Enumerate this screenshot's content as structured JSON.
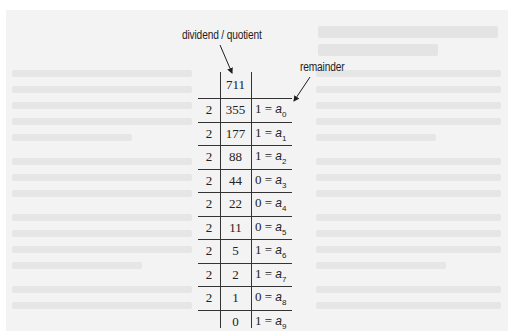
{
  "diagram": {
    "labels": {
      "dividend_quotient": "dividend / quotient",
      "remainder": "remainder"
    },
    "divisor": "2",
    "start_value": "711",
    "remainder_symbol": "a",
    "rows": [
      {
        "divisor": "2",
        "quotient": "355",
        "remainder": "1",
        "index": "0"
      },
      {
        "divisor": "2",
        "quotient": "177",
        "remainder": "1",
        "index": "1"
      },
      {
        "divisor": "2",
        "quotient": "88",
        "remainder": "1",
        "index": "2"
      },
      {
        "divisor": "2",
        "quotient": "44",
        "remainder": "0",
        "index": "3"
      },
      {
        "divisor": "2",
        "quotient": "22",
        "remainder": "0",
        "index": "4"
      },
      {
        "divisor": "2",
        "quotient": "11",
        "remainder": "0",
        "index": "5"
      },
      {
        "divisor": "2",
        "quotient": "5",
        "remainder": "1",
        "index": "6"
      },
      {
        "divisor": "2",
        "quotient": "2",
        "remainder": "1",
        "index": "7"
      },
      {
        "divisor": "2",
        "quotient": "1",
        "remainder": "0",
        "index": "8"
      },
      {
        "divisor": "",
        "quotient": "0",
        "remainder": "1",
        "index": "9"
      }
    ]
  }
}
